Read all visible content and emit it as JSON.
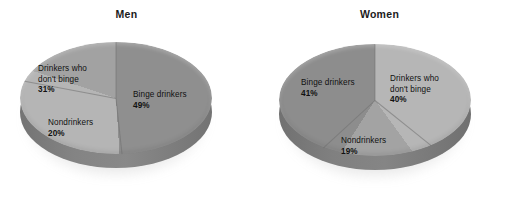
{
  "figure": {
    "background_color": "#ffffff",
    "width": 506,
    "height": 206
  },
  "chart_data": [
    {
      "type": "pie",
      "title": "Men",
      "categories": [
        "Binge drinkers",
        "Drinkers who don't binge",
        "Nondrinkers"
      ],
      "values": [
        49,
        31,
        20
      ],
      "value_labels": [
        "49%",
        "40%",
        "20%"
      ],
      "unit": "percent",
      "legend": "none",
      "labels_inside": true,
      "three_d": true,
      "start_angle_deg": 0,
      "direction": "clockwise",
      "slice_colors": [
        "#8f8f8f",
        "#b5b5b5",
        "#a2a2a2"
      ],
      "side_color": "#8e8e8e"
    },
    {
      "type": "pie",
      "title": "Women",
      "categories": [
        "Drinkers who don't binge",
        "Nondrinkers",
        "Binge drinkers"
      ],
      "values": [
        40,
        19,
        41
      ],
      "value_labels": [
        "40%",
        "19%",
        "41%"
      ],
      "unit": "percent",
      "legend": "none",
      "labels_inside": true,
      "three_d": true,
      "start_angle_deg": 0,
      "direction": "clockwise",
      "exploded_slice": "Nondrinkers",
      "slice_colors": [
        "#b6b6b6",
        "#a3a3a3",
        "#8d8d8d"
      ],
      "side_color": "#8a8a8a"
    }
  ],
  "men": {
    "title": "Men",
    "slices": {
      "binge": {
        "name": "Binge drinkers",
        "pct": "49%"
      },
      "dont_binge_line1": "Drinkers who",
      "dont_binge_line2": "don't binge",
      "dont_binge_pct": "31%",
      "nondrinkers": {
        "name": "Nondrinkers",
        "pct": "20%"
      }
    }
  },
  "women": {
    "title": "Women",
    "slices": {
      "binge": {
        "name": "Binge drinkers",
        "pct": "41%"
      },
      "dont_binge_line1": "Drinkers who",
      "dont_binge_line2": "don't binge",
      "dont_binge_pct": "40%",
      "nondrinkers": {
        "name": "Nondrinkers",
        "pct": "19%"
      }
    }
  }
}
